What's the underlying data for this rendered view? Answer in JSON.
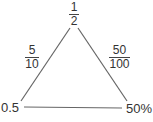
{
  "diagram": {
    "type": "triangle",
    "line_color": "#555555",
    "vertices": {
      "top": {
        "label_num": "1",
        "label_den": "2"
      },
      "bottom_left": {
        "label": "0.5"
      },
      "bottom_right": {
        "label": "50%"
      }
    },
    "edges": {
      "left": {
        "label_num": "5",
        "label_den": "10"
      },
      "right": {
        "label_num": "50",
        "label_den": "100"
      }
    }
  }
}
